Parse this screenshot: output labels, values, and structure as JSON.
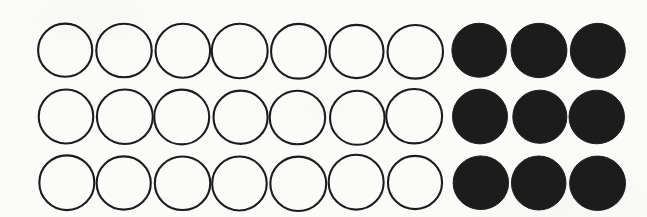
{
  "figure": {
    "kind": "circle-grid-diagram",
    "background_color": "#fbfbfa",
    "outline_color": "#1d1d1d",
    "fill_color": "#1e1e1e",
    "stroke_width": 2.1,
    "columns": 10,
    "rows": 3,
    "total_circles": 30,
    "filled_count": 9,
    "open_count": 21,
    "filled_start_column": 8,
    "geometry": {
      "width": 647,
      "height": 217,
      "radius_x": 27.5,
      "radius_y": 27.0,
      "column_centers": [
        66,
        124,
        182,
        240,
        298,
        357,
        415,
        480,
        539,
        597
      ],
      "row_centers": [
        51,
        117,
        183
      ]
    },
    "cells": [
      {
        "row": 0,
        "states": [
          "open",
          "open",
          "open",
          "open",
          "open",
          "open",
          "open",
          "filled",
          "filled",
          "filled"
        ]
      },
      {
        "row": 1,
        "states": [
          "open",
          "open",
          "open",
          "open",
          "open",
          "open",
          "open",
          "filled",
          "filled",
          "filled"
        ]
      },
      {
        "row": 2,
        "states": [
          "open",
          "open",
          "open",
          "open",
          "open",
          "open",
          "open",
          "filled",
          "filled",
          "filled"
        ]
      }
    ]
  }
}
